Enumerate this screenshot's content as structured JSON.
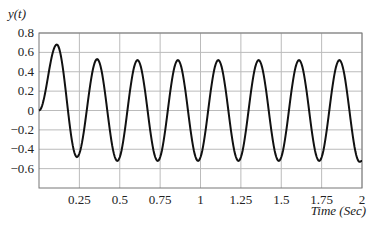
{
  "chart_data": {
    "type": "line",
    "title": "",
    "ylabel": "y(t)",
    "xlabel": "Time (Sec)",
    "xlim": [
      0,
      2
    ],
    "ylim": [
      -0.8,
      0.8
    ],
    "grid": true,
    "x_ticks": [
      0.25,
      0.5,
      0.75,
      1,
      1.25,
      1.5,
      1.75,
      2
    ],
    "x_tick_labels": [
      "0.25",
      "0.5",
      "0.75",
      "1",
      "1.25",
      "1.5",
      "1.75",
      "2"
    ],
    "y_ticks": [
      0.8,
      0.6,
      0.4,
      0.2,
      0,
      -0.2,
      -0.4,
      -0.6
    ],
    "y_tick_labels": [
      "0.8",
      "0.6",
      "0.4",
      "0.2",
      "0",
      "−0.2",
      "−0.4",
      "−0.6"
    ],
    "series": [
      {
        "name": "y(t)",
        "description": "Damped-transient sinusoid settling to steady-state oscillation, period ~0.25 s",
        "x": [
          0,
          0.11,
          0.235,
          0.36,
          0.485,
          0.61,
          0.735,
          0.86,
          0.985,
          1.11,
          1.235,
          1.36,
          1.485,
          1.61,
          1.735,
          1.86,
          1.985,
          2.0
        ],
        "values": [
          0,
          0.68,
          -0.48,
          0.53,
          -0.52,
          0.52,
          -0.52,
          0.52,
          -0.52,
          0.52,
          -0.52,
          0.52,
          -0.52,
          0.52,
          -0.52,
          0.52,
          -0.53,
          -0.52
        ]
      }
    ]
  }
}
